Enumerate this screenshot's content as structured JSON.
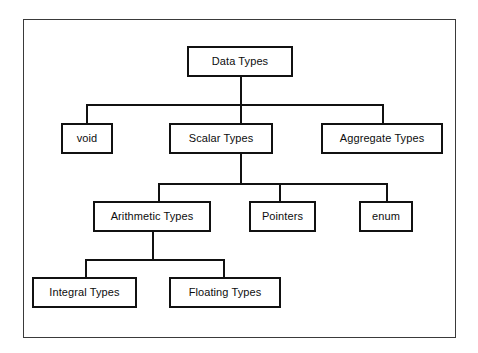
{
  "diagram": {
    "type": "tree",
    "background_color": "#ffffff",
    "line_color": "#111111",
    "frame_color": "#3a3a3a",
    "nodes": [
      {
        "id": "data-types",
        "label": "Data Types",
        "level": 1,
        "parent": null
      },
      {
        "id": "void",
        "label": "void",
        "level": 2,
        "parent": "data-types"
      },
      {
        "id": "scalar-types",
        "label": "Scalar Types",
        "level": 2,
        "parent": "data-types"
      },
      {
        "id": "aggregate-types",
        "label": "Aggregate Types",
        "level": 2,
        "parent": "data-types"
      },
      {
        "id": "arithmetic-types",
        "label": "Arithmetic Types",
        "level": 3,
        "parent": "scalar-types"
      },
      {
        "id": "pointers",
        "label": "Pointers",
        "level": 3,
        "parent": "scalar-types"
      },
      {
        "id": "enum",
        "label": "enum",
        "level": 3,
        "parent": "scalar-types"
      },
      {
        "id": "integral-types",
        "label": "Integral Types",
        "level": 4,
        "parent": "arithmetic-types"
      },
      {
        "id": "floating-types",
        "label": "Floating Types",
        "level": 4,
        "parent": "arithmetic-types"
      }
    ]
  }
}
